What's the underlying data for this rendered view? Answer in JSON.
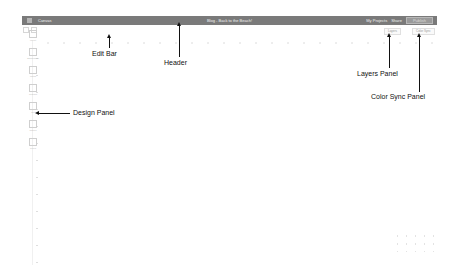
{
  "header": {
    "app_name": "Canvas",
    "document_title": "Blog - Back to the Beach!",
    "my_projects_label": "My Projects",
    "share_label": "Share",
    "publish_label": "Publish"
  },
  "design_panel": {
    "tools": [
      {
        "label": "Layout",
        "icon": "layout-icon"
      },
      {
        "label": "Backgrounds",
        "icon": "background-icon"
      },
      {
        "label": "Photos",
        "icon": "photo-icon"
      },
      {
        "label": "Graphics",
        "icon": "graphics-icon"
      },
      {
        "label": "Text",
        "icon": "text-icon"
      },
      {
        "label": "Shapes",
        "icon": "shape-icon"
      },
      {
        "label": "Colors",
        "icon": "color-icon"
      }
    ]
  },
  "right_panels": {
    "layers_label": "Layers",
    "color_sync_label": "Color Sync"
  },
  "annotations": {
    "edit_bar": "Edit Bar",
    "header": "Header",
    "layers_panel": "Layers Panel",
    "color_sync_panel": "Color Sync Panel",
    "design_panel": "Design Panel"
  },
  "colors": {
    "header_bg": "#7a7a7a",
    "annotation": "#111111",
    "canvas_bg": "#ffffff"
  }
}
